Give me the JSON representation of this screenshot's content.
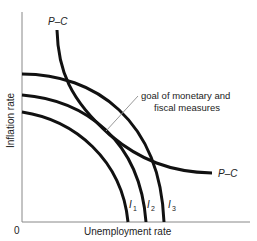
{
  "diagram": {
    "title": "",
    "axes": {
      "x_label": "Unemployment rate",
      "y_label": "Inflation rate",
      "origin_label": "0"
    },
    "curves": [
      {
        "id": "pc",
        "label_top": "P–C",
        "label_right": "P–C",
        "description": "Phillips curve"
      },
      {
        "id": "i1",
        "label": "I",
        "subscript": "1"
      },
      {
        "id": "i2",
        "label": "I",
        "subscript": "2"
      },
      {
        "id": "i3",
        "label": "I",
        "subscript": "3"
      }
    ],
    "annotation": {
      "line1": "goal of monetary and",
      "line2": "fiscal measures"
    },
    "colors": {
      "curve": "#111111",
      "axis": "#888888",
      "leader": "#999999",
      "text": "#222222"
    }
  }
}
